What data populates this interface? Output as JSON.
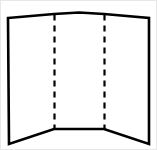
{
  "figure": {
    "description": "Line drawing of an open three-panel folding display board viewed from the front, with two vertical dashed fold lines dividing the left, center and right panels.",
    "background_color": "#ffffff",
    "frame_color": "#e8e8e8",
    "canvas": {
      "width": 157,
      "height": 150
    }
  },
  "shape": {
    "outline": {
      "name": "board-outline",
      "stroke_color": "#000000",
      "fill_color": "#ffffff",
      "stroke_width": 2.6,
      "points": "7,17 53,13 78,11.5 103,13 148,17 148,143 103,128 78,128 53,128 8,143"
    },
    "fold_lines": [
      {
        "name": "fold-line-left",
        "x": 53.5,
        "y_top": 13.5,
        "y_bottom": 128,
        "stroke_color": "#000000",
        "stroke_width": 2.2,
        "dash_length": 6,
        "gap_length": 5
      },
      {
        "name": "fold-line-right",
        "x": 103.5,
        "y_top": 13.5,
        "y_bottom": 128,
        "stroke_color": "#000000",
        "stroke_width": 2.2,
        "dash_length": 6,
        "gap_length": 5
      }
    ],
    "panels": [
      {
        "name": "panel-left",
        "label": "left panel"
      },
      {
        "name": "panel-center",
        "label": "center panel"
      },
      {
        "name": "panel-right",
        "label": "right panel"
      }
    ]
  }
}
